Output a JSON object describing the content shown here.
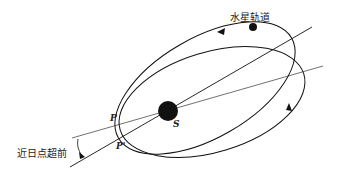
{
  "diagram": {
    "orbit_label": "水星轨道",
    "precession_label": "近日点超前",
    "sun_label": "S",
    "perihelion_label": "P",
    "new_perihelion_label": "P'",
    "colors": {
      "ink": "#111111",
      "background": "#ffffff"
    }
  }
}
